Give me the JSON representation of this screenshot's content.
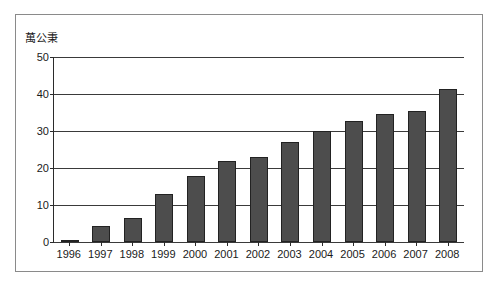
{
  "chart_data": {
    "type": "bar",
    "title": "",
    "subtitle": "",
    "xlabel": "",
    "ylabel": "萬公秉",
    "categories": [
      "1996",
      "1997",
      "1998",
      "1999",
      "2000",
      "2001",
      "2002",
      "2003",
      "2004",
      "2005",
      "2006",
      "2007",
      "2008"
    ],
    "values": [
      0.2,
      4.3,
      6.4,
      13.1,
      17.9,
      22.0,
      23.0,
      27.0,
      30.0,
      32.8,
      34.5,
      35.4,
      41.3
    ],
    "series": [
      {
        "name": "",
        "values": [
          0.2,
          4.3,
          6.4,
          13.1,
          17.9,
          22.0,
          23.0,
          27.0,
          30.0,
          32.8,
          34.5,
          35.4,
          41.3
        ]
      }
    ],
    "ylim": [
      0,
      50
    ],
    "yticks": [
      0,
      10,
      20,
      30,
      40,
      50
    ],
    "ytick_labels": [
      "0",
      "10",
      "20",
      "30",
      "40",
      "50"
    ],
    "grid": true,
    "grid_axis": "y",
    "legend": false,
    "legend_position": "none",
    "bar_color": "#4d4d4d",
    "bar_border_color": "#222222",
    "axis_color": "#2b2b2b",
    "frame_color": "#8a8a8a",
    "background": "#ffffff"
  }
}
